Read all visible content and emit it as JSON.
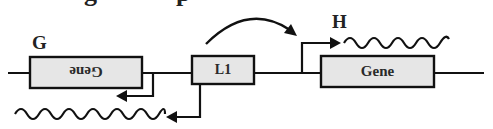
{
  "diagram": {
    "title_partial": "g     p",
    "colors": {
      "line": "#111111",
      "box_fill": "#e6e6e6",
      "box_stroke": "#111111",
      "text": "#2a2a2a"
    },
    "labels": {
      "G": "G",
      "H": "H"
    },
    "boxes": [
      {
        "id": "gene-left",
        "label": "Gene",
        "mirrored": true
      },
      {
        "id": "l1",
        "label": "L1",
        "mirrored": false
      },
      {
        "id": "gene-right",
        "label": "Gene",
        "mirrored": false
      }
    ],
    "elements": {
      "baseline": "DNA strand",
      "promoter_G": "Promoter arrow pointing left from Gene (G)",
      "promoter_L1": "Promoter arrow pointing left from L1",
      "promoter_H": "Promoter arrow pointing right into Gene (H)",
      "curved_arrow": "Curved arrow from L1 region to H promoter",
      "transcript_left": "Antisense transcript (wavy line, left)",
      "transcript_right": "Sense transcript (wavy line, right)"
    }
  }
}
